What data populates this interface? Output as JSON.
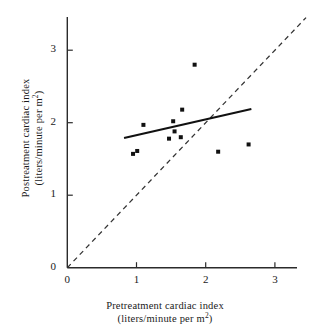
{
  "chart_data": {
    "type": "scatter",
    "title": "",
    "xlabel": "Pretreatment cardiac index",
    "xlabel_units": "(liters/minute per m²)",
    "ylabel": "Postreatment cardiac index",
    "ylabel_units": "(liters/minute per m²)",
    "xlim": [
      0,
      3.5
    ],
    "ylim": [
      0,
      3.45
    ],
    "xticks": [
      0,
      1,
      2,
      3
    ],
    "yticks": [
      0,
      1,
      2,
      3
    ],
    "xticklabels": [
      "0",
      "1",
      "2",
      "3"
    ],
    "yticklabels": [
      "0",
      "1",
      "2",
      "3"
    ],
    "grid": false,
    "legend": "none",
    "points": [
      {
        "x": 0.95,
        "y": 1.57
      },
      {
        "x": 1.1,
        "y": 1.97
      },
      {
        "x": 1.01,
        "y": 1.61
      },
      {
        "x": 1.47,
        "y": 1.78
      },
      {
        "x": 1.53,
        "y": 2.02
      },
      {
        "x": 1.55,
        "y": 1.88
      },
      {
        "x": 1.64,
        "y": 1.8
      },
      {
        "x": 1.66,
        "y": 2.18
      },
      {
        "x": 1.84,
        "y": 2.8
      },
      {
        "x": 2.18,
        "y": 1.6
      },
      {
        "x": 2.62,
        "y": 1.7
      }
    ],
    "regression_line": {
      "style": "solid",
      "x_start": 0.82,
      "y_start": 1.79,
      "x_end": 2.66,
      "y_end": 2.19
    },
    "identity_line": {
      "style": "dashed",
      "label": "y = x",
      "x_start": 0.0,
      "y_start": 0.0,
      "x_end": 3.45,
      "y_end": 3.45
    },
    "marker": {
      "shape": "square",
      "color": "#111111",
      "size_px": 4
    }
  },
  "colors": {
    "axis": "#2b2b2b",
    "marker": "#111111",
    "fit_line": "#111111",
    "identity_line": "#333333",
    "background": "#ffffff"
  }
}
